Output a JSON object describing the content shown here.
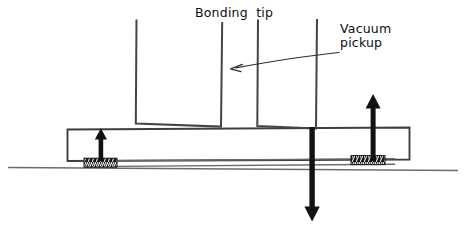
{
  "figure": {
    "width": 466,
    "height": 234,
    "background": "#ffffff",
    "ink_color": "#141414",
    "line_color": "#4a4a4a"
  },
  "labels": {
    "bonding_tip": "Bonding  tip",
    "vacuum_pickup_line1": "Vacuum",
    "vacuum_pickup_line2": "pickup"
  },
  "parts": {
    "bonding_tip": {
      "name": "Bonding tip",
      "shape": "open-top U channel outline",
      "left_x": 135,
      "right_x": 222,
      "top_y": 19,
      "bottom_y": 127
    },
    "vacuum_pickup": {
      "name": "Vacuum pickup",
      "shape": "open-top U channel outline with through shaft",
      "left_x": 257,
      "right_x": 317,
      "top_y": 19,
      "bottom_y": 127
    },
    "component_body": {
      "name": "Component body",
      "left_x": 67,
      "right_x": 410,
      "top_y": 128,
      "bottom_y": 160
    },
    "board_line": {
      "name": "Board / substrate surface",
      "left_x": 8,
      "right_x": 458,
      "y": 168
    },
    "solder_pad_left": {
      "name": "Solder joint (left)",
      "left_x": 84,
      "right_x": 117,
      "top_y": 158,
      "bottom_y": 167
    },
    "solder_pad_right": {
      "name": "Solder joint (right)",
      "left_x": 351,
      "right_x": 385,
      "top_y": 158,
      "bottom_y": 167
    }
  },
  "arrows": {
    "left_up": {
      "name": "Lift force arrow (left)",
      "direction": "up",
      "x": 101,
      "tail_y": 160,
      "head_y": 129
    },
    "right_up": {
      "name": "Lift force arrow (right)",
      "direction": "up",
      "x": 373,
      "tail_y": 160,
      "head_y": 96
    },
    "down": {
      "name": "Vacuum pickup down force arrow",
      "direction": "down",
      "x": 312,
      "tail_y": 131,
      "head_y": 220
    },
    "leader": {
      "name": "Vacuum pickup leader arrow",
      "direction": "left",
      "from_x": 338,
      "from_y": 53,
      "to_x": 232,
      "to_y": 68
    }
  }
}
